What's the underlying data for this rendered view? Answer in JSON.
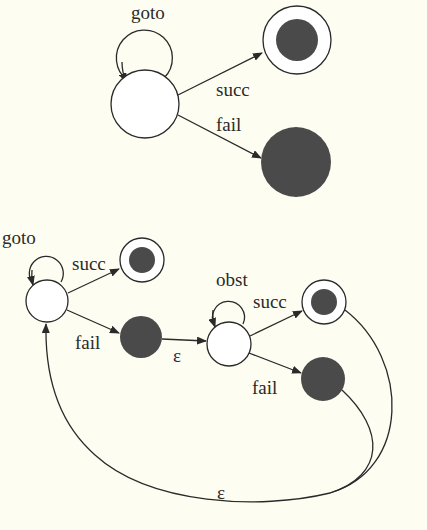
{
  "diagram": {
    "top": {
      "loop_label": "goto",
      "succ_label": "succ",
      "fail_label": "fail"
    },
    "bottom": {
      "left_loop_label": "goto",
      "left_succ_label": "succ",
      "left_fail_label": "fail",
      "epsilon_mid": "ε",
      "mid_loop_label": "obst",
      "right_succ_label": "succ",
      "right_fail_label": "fail",
      "epsilon_back": "ε"
    },
    "colors": {
      "background": "#fdfdf2",
      "stroke": "#2a2a2a",
      "fill_dark": "#4a4a4a"
    }
  }
}
